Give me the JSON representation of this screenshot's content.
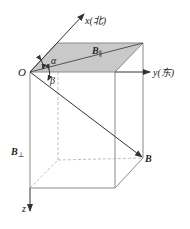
{
  "diagram": {
    "type": "3d-coordinate-vector-decomposition",
    "colors": {
      "line": "#8a8a8a",
      "axis": "#333333",
      "plane_fill": "#c9c9c9",
      "vector": "#333333",
      "background": "#ffffff"
    },
    "labels": {
      "origin": "O",
      "x_axis": "x(北)",
      "y_axis": "y(东)",
      "z_axis": "z",
      "b_parallel_main": "B",
      "b_parallel_sub": "∥",
      "b_perp_main": "B",
      "b_perp_sub": "⊥",
      "b_vector": "B",
      "alpha": "α",
      "beta": "β"
    }
  }
}
